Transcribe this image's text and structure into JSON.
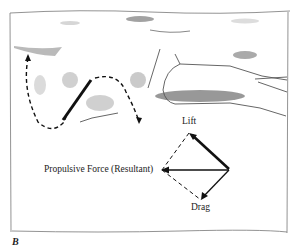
{
  "figure": {
    "panel_letter": "B",
    "vector_diagram": {
      "labels": {
        "lift": "Lift",
        "resultant": "Propulsive Force (Resultant)",
        "drag": "Drag"
      }
    }
  }
}
